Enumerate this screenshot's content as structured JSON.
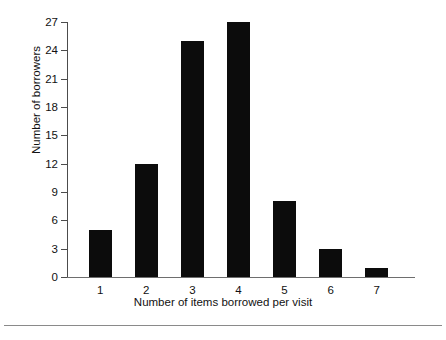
{
  "chart_data": {
    "type": "bar",
    "title": "",
    "subtitle": "",
    "xlabel": "Number of items borrowed per visit",
    "ylabel": "Number of borrowers",
    "categories": [
      "1",
      "2",
      "3",
      "4",
      "5",
      "6",
      "7"
    ],
    "values": [
      5,
      12,
      25,
      27,
      8,
      3,
      1
    ],
    "series": [
      {
        "name": "Number of borrowers",
        "values": [
          5,
          12,
          25,
          27,
          8,
          3,
          1
        ]
      }
    ],
    "ylim": [
      0,
      27
    ],
    "yticks": [
      0,
      3,
      6,
      9,
      12,
      15,
      18,
      21,
      24,
      27
    ],
    "ytick_labels": [
      "0",
      "3",
      "6",
      "9",
      "12",
      "15",
      "18",
      "21",
      "24",
      "27"
    ],
    "xtick_labels": [
      "1",
      "2",
      "3",
      "4",
      "5",
      "6",
      "7"
    ],
    "grid": false,
    "legend": null,
    "legend_position": "none",
    "annotations": [],
    "bar_color": "#0c0c0c",
    "axis_color": "#4c4c4c",
    "background_color": "#ffffff"
  }
}
